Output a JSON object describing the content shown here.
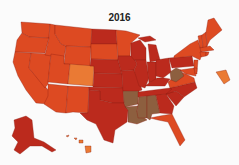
{
  "title": "2016",
  "palette": {
    "light_orange": "#ea7a34",
    "red_orange": "#dd4a22",
    "dark_red": "#bb2a1d",
    "brown": "#8d5f3f"
  },
  "chart_data": {
    "type": "choropleth",
    "title": "2016",
    "region": "United States",
    "legend": [],
    "classes": {
      "light_orange": [
        "CO",
        "DC",
        "HI"
      ],
      "red_orange": [
        "WA",
        "OR",
        "CA",
        "NV",
        "ID",
        "MT",
        "WY",
        "UT",
        "AZ",
        "NM",
        "SD",
        "MN",
        "ME",
        "NH",
        "VT",
        "MA",
        "NY",
        "NJ",
        "FL",
        "VA",
        "DE",
        "CT",
        "RI",
        "MD"
      ],
      "dark_red": [
        "ND",
        "NE",
        "KS",
        "OK",
        "TX",
        "IA",
        "MO",
        "WI",
        "IL",
        "MI",
        "IN",
        "OH",
        "KY",
        "TN",
        "NC",
        "SC",
        "GA",
        "PA",
        "AK"
      ],
      "brown": [
        "AR",
        "LA",
        "MS",
        "AL",
        "WV"
      ]
    }
  },
  "states": [
    {
      "id": "WA",
      "cls": "red_orange",
      "d": "M21,22 L50,24 L49,38 L29,37 L22,33 Z"
    },
    {
      "id": "OR",
      "cls": "red_orange",
      "d": "M22,33 L29,37 L49,38 L45,53 L15,52 L17,40 Z"
    },
    {
      "id": "CA",
      "cls": "red_orange",
      "d": "M15,52 L31,53 L29,68 L50,92 L48,104 L36,103 L26,90 L18,76 L13,62 Z"
    },
    {
      "id": "NV",
      "cls": "red_orange",
      "d": "M31,53 L51,54 L48,84 L45,88 L29,68 Z"
    },
    {
      "id": "ID",
      "cls": "red_orange",
      "d": "M50,24 L55,25 L55,34 L61,44 L66,46 L64,58 L45,55 L49,38 Z"
    },
    {
      "id": "MT",
      "cls": "red_orange",
      "d": "M55,25 L92,29 L91,47 L66,46 L61,44 L55,34 Z"
    },
    {
      "id": "WY",
      "cls": "red_orange",
      "d": "M66,46 L91,47 L90,66 L64,64 Z"
    },
    {
      "id": "UT",
      "cls": "red_orange",
      "d": "M51,54 L64,56 L64,64 L70,64 L68,84 L48,82 Z"
    },
    {
      "id": "CO",
      "cls": "light_orange",
      "d": "M70,64 L94,66 L93,86 L68,84 Z"
    },
    {
      "id": "AZ",
      "cls": "red_orange",
      "d": "M48,84 L68,86 L66,113 L56,112 L44,104 L48,96 Z"
    },
    {
      "id": "NM",
      "cls": "red_orange",
      "d": "M68,86 L89,87 L88,113 L73,112 L66,113 Z"
    },
    {
      "id": "ND",
      "cls": "dark_red",
      "d": "M92,29 L116,30 L117,44 L91,44 Z"
    },
    {
      "id": "SD",
      "cls": "red_orange",
      "d": "M91,44 L117,44 L118,60 L91,59 Z"
    },
    {
      "id": "NE",
      "cls": "dark_red",
      "d": "M91,59 L118,60 L122,74 L94,73 L94,66 L90,66 Z"
    },
    {
      "id": "KS",
      "cls": "dark_red",
      "d": "M94,73 L122,74 L123,88 L93,87 Z"
    },
    {
      "id": "OK",
      "cls": "dark_red",
      "d": "M89,87 L123,88 L124,103 L112,103 L100,100 L100,91 L89,90 Z"
    },
    {
      "id": "TX",
      "cls": "dark_red",
      "d": "M89,90 L100,91 L100,100 L112,103 L124,103 L128,110 L127,122 L115,130 L113,143 L104,140 L96,124 L87,120 L80,113 L88,113 Z"
    },
    {
      "id": "MN",
      "cls": "red_orange",
      "d": "M116,30 L126,31 L140,35 L131,43 L130,56 L118,56 L117,44 Z"
    },
    {
      "id": "IA",
      "cls": "dark_red",
      "d": "M118,56 L133,56 L137,64 L134,70 L121,71 L118,60 Z"
    },
    {
      "id": "MO",
      "cls": "dark_red",
      "d": "M121,71 L134,70 L139,80 L142,90 L136,92 L123,91 L122,74 Z"
    },
    {
      "id": "AR",
      "cls": "brown",
      "d": "M123,91 L139,91 L138,104 L125,107 L124,103 Z"
    },
    {
      "id": "LA",
      "cls": "brown",
      "d": "M125,107 L138,106 L137,112 L147,120 L137,124 L128,122 L128,110 Z"
    },
    {
      "id": "WI",
      "cls": "dark_red",
      "d": "M131,43 L140,40 L146,48 L146,60 L134,60 L131,56 Z"
    },
    {
      "id": "IL",
      "cls": "dark_red",
      "d": "M135,60 L146,60 L149,78 L145,88 L139,86 L134,70 L137,64 Z"
    },
    {
      "id": "MI",
      "cls": "dark_red",
      "d": "M148,44 L156,45 L160,60 L150,62 L149,52 Z M138,38 L150,36 L156,40 L145,42 Z"
    },
    {
      "id": "IN",
      "cls": "dark_red",
      "d": "M147,62 L156,62 L156,80 L149,83 Z"
    },
    {
      "id": "OH",
      "cls": "dark_red",
      "d": "M156,60 L169,58 L171,72 L163,78 L156,76 Z"
    },
    {
      "id": "KY",
      "cls": "dark_red",
      "d": "M145,86 L149,83 L157,78 L164,78 L170,79 L165,86 Z"
    },
    {
      "id": "TN",
      "cls": "dark_red",
      "d": "M138,92 L170,88 L176,87 L172,94 L138,97 Z"
    },
    {
      "id": "MS",
      "cls": "brown",
      "d": "M139,97 L147,96 L147,118 L138,118 L137,112 L138,104 Z"
    },
    {
      "id": "AL",
      "cls": "brown",
      "d": "M147,96 L156,95 L160,113 L152,114 L150,120 L147,118 Z"
    },
    {
      "id": "GA",
      "cls": "dark_red",
      "d": "M156,95 L166,94 L174,106 L172,114 L160,113 Z"
    },
    {
      "id": "FL",
      "cls": "red_orange",
      "d": "M150,118 L160,116 L172,114 L178,126 L185,140 L180,146 L174,134 L168,122 L158,120 Z"
    },
    {
      "id": "SC",
      "cls": "dark_red",
      "d": "M166,94 L176,91 L184,97 L176,106 Z"
    },
    {
      "id": "NC",
      "cls": "dark_red",
      "d": "M170,88 L195,82 L197,88 L184,97 L176,91 L166,94 L172,89 Z"
    },
    {
      "id": "VA",
      "cls": "red_orange",
      "d": "M168,82 L180,72 L186,74 L194,78 L195,82 L170,88 Z"
    },
    {
      "id": "WV",
      "cls": "brown",
      "d": "M170,72 L176,68 L181,70 L184,76 L176,82 L171,80 Z"
    },
    {
      "id": "PA",
      "cls": "dark_red",
      "d": "M169,58 L192,56 L194,66 L172,68 Z"
    },
    {
      "id": "NY",
      "cls": "red_orange",
      "d": "M174,56 L190,44 L198,40 L202,54 L200,60 L192,56 L174,58 Z"
    },
    {
      "id": "NJ",
      "cls": "red_orange",
      "d": "M194,60 L198,60 L197,72 L194,70 Z"
    },
    {
      "id": "MD",
      "cls": "red_orange",
      "d": "M180,70 L194,68 L196,76 L186,74 Z"
    },
    {
      "id": "DE",
      "cls": "red_orange",
      "d": "M194,68 L197,68 L197,74 L195,74 Z"
    },
    {
      "id": "VT",
      "cls": "red_orange",
      "d": "M198,36 L202,35 L203,48 L200,48 Z"
    },
    {
      "id": "NH",
      "cls": "red_orange",
      "d": "M202,35 L206,32 L207,47 L203,48 Z"
    },
    {
      "id": "ME",
      "cls": "red_orange",
      "d": "M206,32 L208,20 L214,18 L222,30 L210,40 L207,46 Z"
    },
    {
      "id": "MA",
      "cls": "red_orange",
      "d": "M200,48 L210,46 L214,50 L201,52 Z"
    },
    {
      "id": "CT",
      "cls": "red_orange",
      "d": "M200,52 L206,52 L206,56 L201,57 Z"
    },
    {
      "id": "RI",
      "cls": "red_orange",
      "d": "M206,52 L209,52 L208,55 L206,56 Z"
    },
    {
      "id": "DC",
      "cls": "light_orange",
      "d": "M216,72 L226,70 L230,80 L224,84 Z"
    },
    {
      "id": "AK",
      "cls": "dark_red",
      "d": "M14,120 L26,116 L32,120 L34,138 L44,142 L56,150 L52,152 L42,146 L30,146 L20,154 L14,150 L18,142 L12,136 L15,128 Z"
    },
    {
      "id": "HI",
      "cls": "light_orange",
      "d": "M85,146 L91,146 L91,152 L86,153 Z M79,140 L83,140 L83,143 L79,143 Z M74,138 L77,138 L76,140 Z M66,136 L69,135 L68,137 Z"
    }
  ]
}
